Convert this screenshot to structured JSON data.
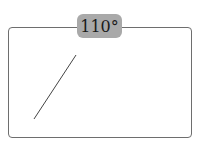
{
  "diagram": {
    "angle_label": "110°",
    "colors": {
      "frame_border": "#6e6e6e",
      "label_bg": "#a9a9a9",
      "line": "#444444"
    },
    "line": {
      "x1": 34,
      "y1": 119,
      "x2": 76,
      "y2": 55
    }
  }
}
